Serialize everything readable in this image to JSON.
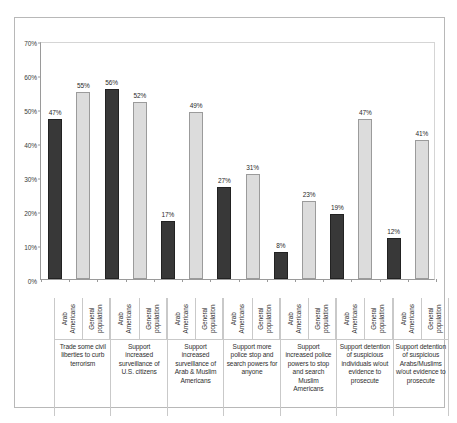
{
  "chart_data": {
    "type": "bar",
    "title": "",
    "subtitle": "",
    "xlabel": "",
    "ylabel": "",
    "ylim": [
      0,
      70
    ],
    "ytick_labels": [
      "0%",
      "10%",
      "20%",
      "30%",
      "40%",
      "50%",
      "60%",
      "70%"
    ],
    "ytick_values": [
      0,
      10,
      20,
      30,
      40,
      50,
      60,
      70
    ],
    "grid": false,
    "legend_position": "none",
    "value_label_suffix": "%",
    "series_names": [
      "Arab Americans",
      "General population"
    ],
    "categories": [
      "Trade some civil liberties to curb terrorism",
      "Support increased surveillance of U.S. citizens",
      "Support increased surveillance of Arab & Muslim Americans",
      "Support more police stop and search powers for anyone",
      "Support increased police powers to stop and search Muslim Americans",
      "Support detention of suspicious individuals w/out evidence to prosecute",
      "Support detention of suspicious Arabs/Muslims w/out evidence to prosecute"
    ],
    "series": [
      {
        "name": "Arab Americans",
        "values": [
          47,
          56,
          17,
          27,
          8,
          19,
          12
        ],
        "color": "#383838"
      },
      {
        "name": "General population",
        "values": [
          55,
          52,
          49,
          31,
          23,
          47,
          41
        ],
        "color": "#dcdcdc"
      }
    ],
    "bars": [
      {
        "category": "Trade some civil liberties to curb terrorism",
        "series": "Arab Americans",
        "value": 47,
        "label": "47%"
      },
      {
        "category": "Trade some civil liberties to curb terrorism",
        "series": "General population",
        "value": 55,
        "label": "55%"
      },
      {
        "category": "Support increased surveillance of U.S. citizens",
        "series": "Arab Americans",
        "value": 56,
        "label": "56%"
      },
      {
        "category": "Support increased surveillance of U.S. citizens",
        "series": "General population",
        "value": 52,
        "label": "52%"
      },
      {
        "category": "Support increased surveillance of Arab & Muslim Americans",
        "series": "Arab Americans",
        "value": 17,
        "label": "17%"
      },
      {
        "category": "Support increased surveillance of Arab & Muslim Americans",
        "series": "General population",
        "value": 49,
        "label": "49%"
      },
      {
        "category": "Support more police stop and search powers for anyone",
        "series": "Arab Americans",
        "value": 27,
        "label": "27%"
      },
      {
        "category": "Support more police stop and search powers for anyone",
        "series": "General population",
        "value": 31,
        "label": "31%"
      },
      {
        "category": "Support increased police powers to stop and search Muslim Americans",
        "series": "Arab Americans",
        "value": 8,
        "label": "8%"
      },
      {
        "category": "Support increased police powers to stop and search Muslim Americans",
        "series": "General population",
        "value": 23,
        "label": "23%"
      },
      {
        "category": "Support detention of suspicious individuals w/out evidence to prosecute",
        "series": "Arab Americans",
        "value": 19,
        "label": "19%"
      },
      {
        "category": "Support detention of suspicious individuals w/out evidence to prosecute",
        "series": "General population",
        "value": 47,
        "label": "47%"
      },
      {
        "category": "Support detention of suspicious Arabs/Muslims w/out evidence to prosecute",
        "series": "Arab Americans",
        "value": 12,
        "label": "12%"
      },
      {
        "category": "Support detention of suspicious Arabs/Muslims w/out evidence to prosecute",
        "series": "General population",
        "value": 41,
        "label": "41%"
      }
    ]
  },
  "colors": {
    "arab_americans_bar": "#383838",
    "general_population_bar": "#dcdcdc",
    "axis_line": "#9a9a9a",
    "frame_border": "#b8b8b8",
    "separator": "#c9c9c9",
    "text": "#2f2f2f",
    "background": "#ffffff"
  }
}
